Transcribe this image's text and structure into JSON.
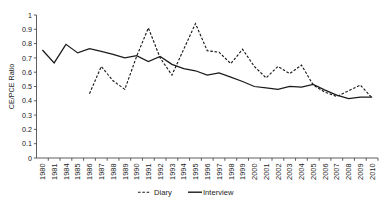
{
  "chart_data": {
    "type": "line",
    "title": "",
    "subtitle": "",
    "xlabel": "",
    "ylabel": "CE/PCE Ratio",
    "ylim": [
      0,
      1
    ],
    "ytick_labels": [
      "0",
      "0.1",
      "0.2",
      "0.3",
      "0.4",
      "0.5",
      "0.6",
      "0.7",
      "0.8",
      "0.9",
      "1"
    ],
    "ytick_values": [
      0,
      0.1,
      0.2,
      0.3,
      0.4,
      0.5,
      0.6,
      0.7,
      0.8,
      0.9,
      1
    ],
    "grid": false,
    "legend_position": "bottom",
    "categories": [
      "1980",
      "1981",
      "1984",
      "1985",
      "1986",
      "1987",
      "1988",
      "1989",
      "1990",
      "1991",
      "1992",
      "1993",
      "1994",
      "1995",
      "1996",
      "1997",
      "1998",
      "1999",
      "2000",
      "2001",
      "2002",
      "2003",
      "2004",
      "2005",
      "2006",
      "2007",
      "2008",
      "2009",
      "2010"
    ],
    "series": [
      {
        "name": "Diary",
        "style": "dashed",
        "color": "#1a1a1a",
        "values": [
          null,
          null,
          null,
          null,
          0.45,
          0.64,
          0.54,
          0.48,
          0.71,
          0.91,
          0.7,
          0.58,
          0.76,
          0.94,
          0.75,
          0.74,
          0.66,
          0.76,
          0.64,
          0.56,
          0.64,
          0.59,
          0.65,
          0.51,
          0.46,
          0.43,
          0.47,
          0.51,
          0.42
        ]
      },
      {
        "name": "Interview",
        "style": "solid",
        "color": "#1a1a1a",
        "values": [
          0.755,
          0.665,
          0.795,
          0.735,
          0.765,
          0.745,
          0.725,
          0.7,
          0.715,
          0.675,
          0.71,
          0.655,
          0.625,
          0.61,
          0.58,
          0.595,
          0.565,
          0.535,
          0.5,
          0.49,
          0.48,
          0.5,
          0.495,
          0.515,
          0.475,
          0.44,
          0.415,
          0.425,
          0.425
        ]
      }
    ]
  },
  "legend": {
    "entries": [
      {
        "label": "Diary",
        "style": "dashed"
      },
      {
        "label": "Interview",
        "style": "solid"
      }
    ]
  }
}
